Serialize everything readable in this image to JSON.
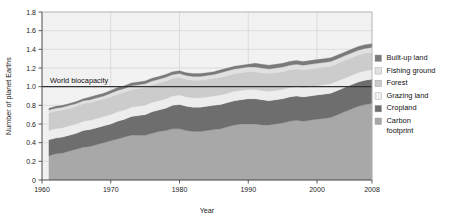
{
  "chart_data": {
    "type": "area",
    "stacked": true,
    "title": "",
    "subtitle": "",
    "xlabel": "Year",
    "ylabel": "Number of planet Earths",
    "xlim": [
      1960,
      2008
    ],
    "ylim": [
      0,
      1.8
    ],
    "xticks": [
      1960,
      1970,
      1980,
      1990,
      2000,
      2008
    ],
    "xtick_labels": [
      "1960",
      "1970",
      "1980",
      "1990",
      "2000",
      "2008"
    ],
    "yticks": [
      0,
      0.2,
      0.4,
      0.6,
      0.8,
      1.0,
      1.2,
      1.4,
      1.6,
      1.8
    ],
    "ytick_labels": [
      "0",
      "0.2",
      "0.4",
      "0.6",
      "0.8",
      "1.0",
      "1.2",
      "1.4",
      "1.6",
      "1.8"
    ],
    "grid": true,
    "grid_color": "#d3d3d3",
    "plot_background": "#f2f2f2",
    "legend_position": "right",
    "annotations": [
      {
        "text": "World biocapacity",
        "y_value": 1.0,
        "line": true,
        "line_color": "#333333"
      }
    ],
    "x": [
      1961,
      1962,
      1963,
      1964,
      1965,
      1966,
      1967,
      1968,
      1969,
      1970,
      1971,
      1972,
      1973,
      1974,
      1975,
      1976,
      1977,
      1978,
      1979,
      1980,
      1981,
      1982,
      1983,
      1984,
      1985,
      1986,
      1987,
      1988,
      1989,
      1990,
      1991,
      1992,
      1993,
      1994,
      1995,
      1996,
      1997,
      1998,
      1999,
      2000,
      2001,
      2002,
      2003,
      2004,
      2005,
      2006,
      2007,
      2008
    ],
    "series": [
      {
        "name": "Carbon footprint",
        "color": "#a8a8a8",
        "values": [
          0.26,
          0.28,
          0.29,
          0.31,
          0.33,
          0.35,
          0.36,
          0.38,
          0.4,
          0.42,
          0.44,
          0.46,
          0.48,
          0.48,
          0.48,
          0.5,
          0.52,
          0.53,
          0.55,
          0.55,
          0.53,
          0.52,
          0.52,
          0.53,
          0.54,
          0.55,
          0.57,
          0.59,
          0.6,
          0.6,
          0.6,
          0.59,
          0.59,
          0.6,
          0.61,
          0.63,
          0.64,
          0.63,
          0.64,
          0.65,
          0.66,
          0.67,
          0.7,
          0.73,
          0.76,
          0.79,
          0.81,
          0.82
        ]
      },
      {
        "name": "Cropland",
        "color": "#6e6e6e",
        "values": [
          0.17,
          0.17,
          0.17,
          0.17,
          0.17,
          0.18,
          0.18,
          0.18,
          0.18,
          0.18,
          0.19,
          0.19,
          0.2,
          0.21,
          0.22,
          0.23,
          0.23,
          0.24,
          0.25,
          0.26,
          0.26,
          0.26,
          0.26,
          0.26,
          0.26,
          0.26,
          0.26,
          0.26,
          0.26,
          0.27,
          0.27,
          0.27,
          0.26,
          0.26,
          0.26,
          0.26,
          0.26,
          0.26,
          0.26,
          0.26,
          0.26,
          0.26,
          0.26,
          0.26,
          0.26,
          0.26,
          0.26,
          0.26
        ]
      },
      {
        "name": "Grazing land",
        "color": "#ededed",
        "values": [
          0.1,
          0.1,
          0.1,
          0.1,
          0.1,
          0.1,
          0.1,
          0.1,
          0.1,
          0.1,
          0.1,
          0.1,
          0.1,
          0.1,
          0.1,
          0.1,
          0.1,
          0.1,
          0.1,
          0.1,
          0.1,
          0.1,
          0.1,
          0.1,
          0.1,
          0.1,
          0.1,
          0.1,
          0.1,
          0.1,
          0.1,
          0.1,
          0.1,
          0.1,
          0.1,
          0.1,
          0.1,
          0.1,
          0.1,
          0.1,
          0.1,
          0.1,
          0.1,
          0.1,
          0.1,
          0.1,
          0.1,
          0.1
        ]
      },
      {
        "name": "Forest",
        "color": "#cccccc",
        "values": [
          0.19,
          0.19,
          0.19,
          0.19,
          0.19,
          0.19,
          0.19,
          0.19,
          0.19,
          0.19,
          0.19,
          0.19,
          0.19,
          0.19,
          0.19,
          0.19,
          0.19,
          0.19,
          0.19,
          0.19,
          0.19,
          0.19,
          0.19,
          0.19,
          0.19,
          0.19,
          0.19,
          0.19,
          0.19,
          0.19,
          0.19,
          0.19,
          0.19,
          0.19,
          0.19,
          0.19,
          0.19,
          0.19,
          0.19,
          0.19,
          0.19,
          0.19,
          0.19,
          0.19,
          0.19,
          0.19,
          0.19,
          0.19
        ]
      },
      {
        "name": "Fishing ground",
        "color": "#e0e0e0",
        "values": [
          0.03,
          0.03,
          0.03,
          0.03,
          0.03,
          0.03,
          0.03,
          0.03,
          0.03,
          0.04,
          0.04,
          0.04,
          0.04,
          0.04,
          0.04,
          0.04,
          0.04,
          0.04,
          0.04,
          0.04,
          0.04,
          0.04,
          0.04,
          0.04,
          0.04,
          0.05,
          0.05,
          0.05,
          0.05,
          0.05,
          0.05,
          0.05,
          0.05,
          0.05,
          0.05,
          0.05,
          0.05,
          0.05,
          0.05,
          0.05,
          0.05,
          0.05,
          0.05,
          0.05,
          0.05,
          0.05,
          0.05,
          0.05
        ]
      },
      {
        "name": "Built-up land",
        "color": "#7a7a7a",
        "values": [
          0.02,
          0.02,
          0.02,
          0.02,
          0.02,
          0.02,
          0.03,
          0.03,
          0.03,
          0.03,
          0.03,
          0.03,
          0.03,
          0.03,
          0.03,
          0.03,
          0.03,
          0.03,
          0.03,
          0.03,
          0.03,
          0.03,
          0.03,
          0.03,
          0.03,
          0.03,
          0.03,
          0.03,
          0.03,
          0.03,
          0.04,
          0.04,
          0.04,
          0.04,
          0.04,
          0.04,
          0.04,
          0.04,
          0.04,
          0.04,
          0.04,
          0.04,
          0.04,
          0.04,
          0.04,
          0.04,
          0.04,
          0.04
        ]
      }
    ],
    "totals": [
      0.77,
      0.79,
      0.8,
      0.82,
      0.84,
      0.87,
      0.89,
      0.91,
      0.93,
      0.96,
      0.99,
      1.01,
      1.04,
      1.05,
      1.06,
      1.09,
      1.11,
      1.13,
      1.16,
      1.17,
      1.15,
      1.14,
      1.14,
      1.15,
      1.16,
      1.18,
      1.2,
      1.22,
      1.23,
      1.24,
      1.25,
      1.24,
      1.23,
      1.24,
      1.25,
      1.27,
      1.28,
      1.27,
      1.28,
      1.29,
      1.3,
      1.31,
      1.34,
      1.37,
      1.4,
      1.43,
      1.45,
      1.46
    ]
  },
  "legend": {
    "items": [
      {
        "label": "Built-up land",
        "color": "#7a7a7a"
      },
      {
        "label": "Fishing ground",
        "color": "#e0e0e0"
      },
      {
        "label": "Forest",
        "color": "#cccccc"
      },
      {
        "label": "Grazing land",
        "color": "#ededed"
      },
      {
        "label": "Cropland",
        "color": "#6e6e6e"
      },
      {
        "label": "Carbon",
        "label2": "footprint",
        "color": "#a8a8a8"
      }
    ]
  },
  "axes": {
    "y_title": "Number of planet Earths",
    "x_title": "Year"
  },
  "annotation": {
    "biocapacity_label": "World biocapacity"
  }
}
